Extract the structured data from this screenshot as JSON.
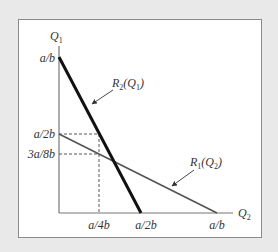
{
  "diagram": {
    "type": "reaction-functions",
    "axes": {
      "y_label": "Q",
      "y_label_sub": "1",
      "x_label": "Q",
      "x_label_sub": "2"
    },
    "y_ticks": [
      {
        "label": "a/b",
        "value": "a/b"
      },
      {
        "label": "a/2b",
        "value": "a/2b"
      },
      {
        "label": "3a/8b",
        "value": "3a/8b"
      }
    ],
    "x_ticks": [
      {
        "label": "a/4b",
        "value": "a/4b"
      },
      {
        "label": "a/2b",
        "value": "a/2b"
      },
      {
        "label": "a/b",
        "value": "a/b"
      }
    ],
    "curves": [
      {
        "name": "R",
        "sub": "2",
        "arg": "Q",
        "arg_sub": "1",
        "from": "(0, a/b)",
        "to": "(a/2b, 0)",
        "style": "thick",
        "color": "#111111"
      },
      {
        "name": "R",
        "sub": "1",
        "arg": "Q",
        "arg_sub": "2",
        "from": "(0, a/2b)",
        "to": "(a/b, 0)",
        "style": "thin",
        "color": "#555555"
      }
    ],
    "guides": [
      {
        "from": "(0, a/2b)",
        "to": "(a/4b, a/2b)",
        "style": "dashed"
      },
      {
        "from": "(a/4b, a/2b)",
        "to": "(a/4b, 0)",
        "style": "dashed"
      },
      {
        "from": "(0, 3a/8b)",
        "to": "(a/4b, 3a/8b)",
        "style": "dashed"
      }
    ],
    "colors": {
      "background": "#e9e9e9",
      "panel": "#ffffff",
      "axis": "#777777",
      "thick_line": "#111111",
      "thin_line": "#555555"
    }
  }
}
